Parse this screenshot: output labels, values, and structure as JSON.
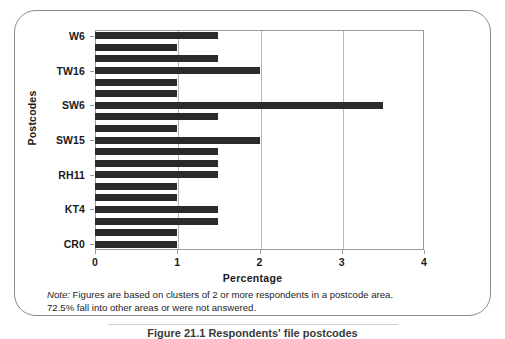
{
  "figure": {
    "y_axis_title": "Postcodes",
    "x_axis_title": "Percentage",
    "note_label": "Note:",
    "note_line1": " Figures are based on clusters of 2 or more respondents in a postcode area.",
    "note_line2": "72.5% fall into other areas or were not answered.",
    "caption": "Figure 21.1  Respondents' file postcodes"
  },
  "chart_data": {
    "type": "bar",
    "orientation": "horizontal",
    "title": "",
    "xlabel": "Percentage",
    "ylabel": "Postcodes",
    "xlim": [
      0,
      4
    ],
    "xticks": [
      0,
      1,
      2,
      3,
      4
    ],
    "xtick_labels": [
      "0",
      "1",
      "2",
      "3",
      "4"
    ],
    "grid": true,
    "legend": false,
    "bar_color": "#2b2b2b",
    "categories": [
      "W6",
      "",
      "",
      "TW16",
      "",
      "",
      "SW6",
      "",
      "",
      "SW15",
      "",
      "",
      "RH11",
      "",
      "",
      "KT4",
      "",
      "",
      "CR0"
    ],
    "visible_category_labels": [
      "W6",
      "TW16",
      "SW6",
      "SW15",
      "RH11",
      "KT4",
      "CR0"
    ],
    "values": [
      1.5,
      1.0,
      1.5,
      2.0,
      1.0,
      1.0,
      3.5,
      1.5,
      1.0,
      2.0,
      1.5,
      1.5,
      1.5,
      1.0,
      1.0,
      1.5,
      1.5,
      1.0,
      1.0
    ]
  }
}
